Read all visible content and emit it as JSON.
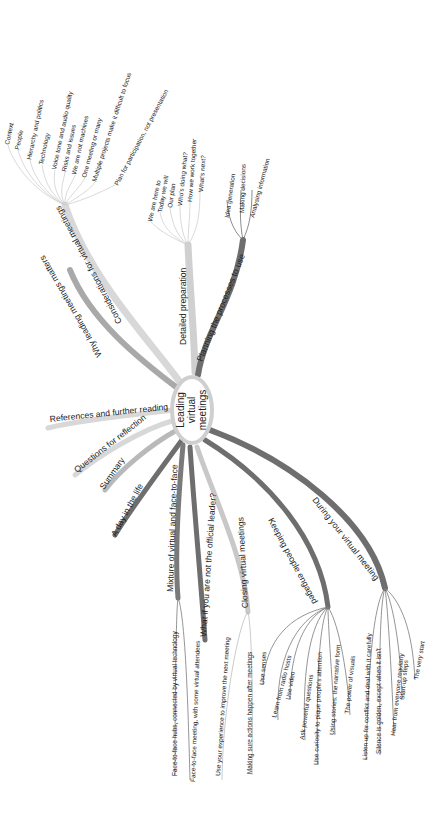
{
  "mindmap": {
    "central": {
      "lines": [
        "Leading",
        "virtual",
        "meetings"
      ]
    },
    "colors": {
      "light": "#d8d8d8",
      "mid": "#a9a9a9",
      "dark": "#6e6e6e",
      "text": "#222222",
      "background": "#ffffff"
    },
    "branches": [
      {
        "label": "Considerations for virtual meetings",
        "children": [
          "Context",
          "People",
          "Hierarchy and politics",
          "Technology",
          "Voice tone and audio quality",
          "Risks and issues",
          "We are not machines",
          "One meeting or many",
          "Multiple projects make it difficult to focus",
          "Plan for participation, not presentation"
        ]
      },
      {
        "label": "Why leading meetings matters",
        "children": []
      },
      {
        "label": "Detailed preparation",
        "children": [
          "We are here to",
          "Today we will",
          "Our plan",
          "Who's doing what?",
          "How we work together",
          "What's next?"
        ]
      },
      {
        "label": "Planning the processes to use",
        "children": [
          "Idea generation",
          "Making decisions",
          "Analysing information"
        ]
      },
      {
        "label": "References and further reading",
        "children": []
      },
      {
        "label": "Questions for reflection",
        "children": []
      },
      {
        "label": "Summary",
        "children": []
      },
      {
        "label": "A day in the life",
        "children": []
      },
      {
        "label": "Mixture of virtual and face-to-face",
        "children": [
          "Face-to-face hubs, connected by virtual technology",
          "Face-to-face meeting, with some virtual attendees"
        ]
      },
      {
        "label": "What if you are not the official leader?",
        "children": []
      },
      {
        "label": "Closing virtual meetings",
        "children": [
          "Use your experience to improve the next meeting",
          "Making sure actions happen after meetings"
        ]
      },
      {
        "label": "Keeping people engaged",
        "children": [
          "Use senses",
          "Learn from radio hosts",
          "Use video",
          "Ask powerful questions",
          "Use curiosity to pique people's attention",
          "Using stories: the narrative form",
          "The power of visuals"
        ]
      },
      {
        "label": "During your virtual meeting",
        "children": [
          "Listen up for conflict and deal with it carefully",
          "Silence is golden, except when it isn't",
          "Hear from everyone regularly",
          "Start-up steps",
          "The very start"
        ]
      }
    ]
  }
}
